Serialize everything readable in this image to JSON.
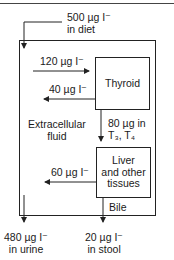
{
  "diagram": {
    "nodes": {
      "thyroid": "Thyroid",
      "liver": [
        "Liver",
        "and other",
        "tissues"
      ],
      "ecf": [
        "Extracellular",
        "fluid"
      ]
    },
    "flows": {
      "diet": [
        "500 µg I⁻",
        "in diet"
      ],
      "to_thyroid": "120 µg I⁻",
      "from_thyroid": "40 µg I⁻",
      "hormones": [
        "80 µg in",
        "T₃, T₄"
      ],
      "from_liver": "60 µg I⁻",
      "bile": "Bile",
      "urine": [
        "480 µg I⁻",
        "in urine"
      ],
      "stool": [
        "20 µg I⁻",
        "in stool"
      ]
    }
  }
}
